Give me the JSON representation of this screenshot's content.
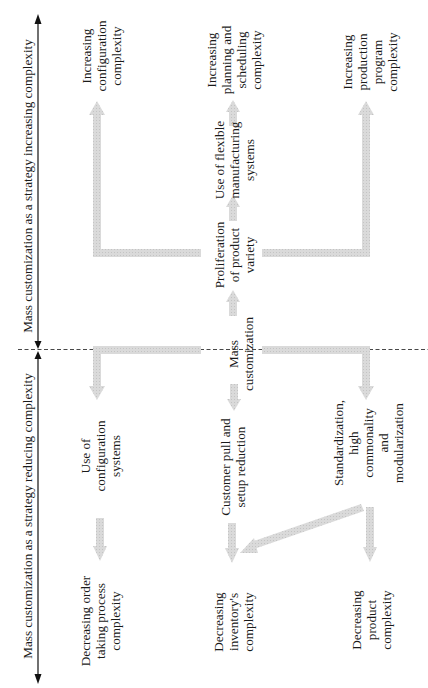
{
  "diagram": {
    "colors": {
      "arrow_fill": "#d6d6d6",
      "axis_line": "#111111",
      "dashed_line": "#333333",
      "text": "#1a1a1a"
    },
    "axis": {
      "top_label": "Mass customization as a strategy increasing complexity",
      "bottom_label": "Mass customization as a strategy reducing complexity"
    },
    "center_node": "Mass\ncustomization",
    "increasing_branch": {
      "left_outcome": "Increasing\nconfiguration\ncomplexity",
      "middle_chain": [
        "Proliferation\nof product\nvariety",
        "Use of flexible\nmanufacturing\nsystems"
      ],
      "middle_outcome": "Increasing\nplanning and\nscheduling\ncomplexity",
      "right_outcome": "Increasing\nproduction\nprogram\ncomplexity"
    },
    "reducing_branch": {
      "left_lever": "Use of\nconfiguration\nsystems",
      "left_outcome": "Decreasing order\ntaking process\ncomplexity",
      "middle_lever": "Customer pull and\nsetup reduction",
      "middle_outcome": "Decreasing\ninventory's\ncomplexity",
      "right_lever": "Standardization, high\ncommonality and\nmodularization",
      "right_outcome": "Decreasing\nproduct\ncomplexity"
    }
  }
}
